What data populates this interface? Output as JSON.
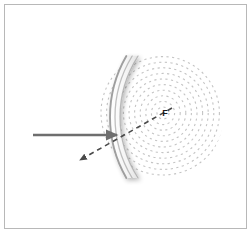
{
  "figure": {
    "domain": "Diagram",
    "background_color": "#ffffff",
    "frame": {
      "border_color": "#b8b8b8",
      "border_width": 1,
      "x": 4,
      "y": 4,
      "width": 243,
      "height": 225
    },
    "labels": {
      "focal_point": "F"
    },
    "colors": {
      "plane_wavefront": "#c9c9c9",
      "circular_wavefront": "#c4c4c4",
      "mirror_stroke": "#9a9a9a",
      "mirror_fill": "#fdfdfd",
      "mirror_shadow": "#dcdcdc",
      "incident_ray": "#6e6e6e",
      "reflected_ray": "#4a4a4a",
      "label_text": "#1a1a1a"
    },
    "plane_wavefronts": {
      "description": "vertical parallel lines representing incoming plane wavefronts",
      "count": 10,
      "x_start": 28,
      "x_spacing": 6.2,
      "y_top": 68,
      "y_bottom": 166,
      "stroke_width": 2.2
    },
    "mirror": {
      "description": "concave mirror drawn as nested arcs with drop shadow",
      "arc_count": 3,
      "center_x": 232,
      "center_y": 117,
      "radii": [
        122,
        117,
        112
      ],
      "top_y": 56,
      "bottom_y": 178,
      "vertex_x": 110
    },
    "circular_wavefronts": {
      "description": "concentric dashed arcs converging on the focal point F",
      "center_x": 163,
      "center_y": 113,
      "ring_count": 11,
      "min_radius": 6,
      "radius_step": 5.6,
      "dash_pattern": "2.2 3.4",
      "stroke_width": 1.1,
      "clip_center_x": 160,
      "clip_center_y": 117,
      "clip_radius": 63
    },
    "incident_ray": {
      "label": "incident ray",
      "style": "solid",
      "x1": 33,
      "y1": 135,
      "x2": 117,
      "y2": 135,
      "stroke_width": 2.6,
      "arrowhead": "right"
    },
    "reflected_ray": {
      "label": "reflected ray",
      "style": "dashed",
      "x1": 172,
      "y1": 108,
      "x2": 80,
      "y2": 160,
      "stroke_width": 1.6,
      "dash_pattern": "5 4",
      "arrowhead": "down-left"
    }
  }
}
